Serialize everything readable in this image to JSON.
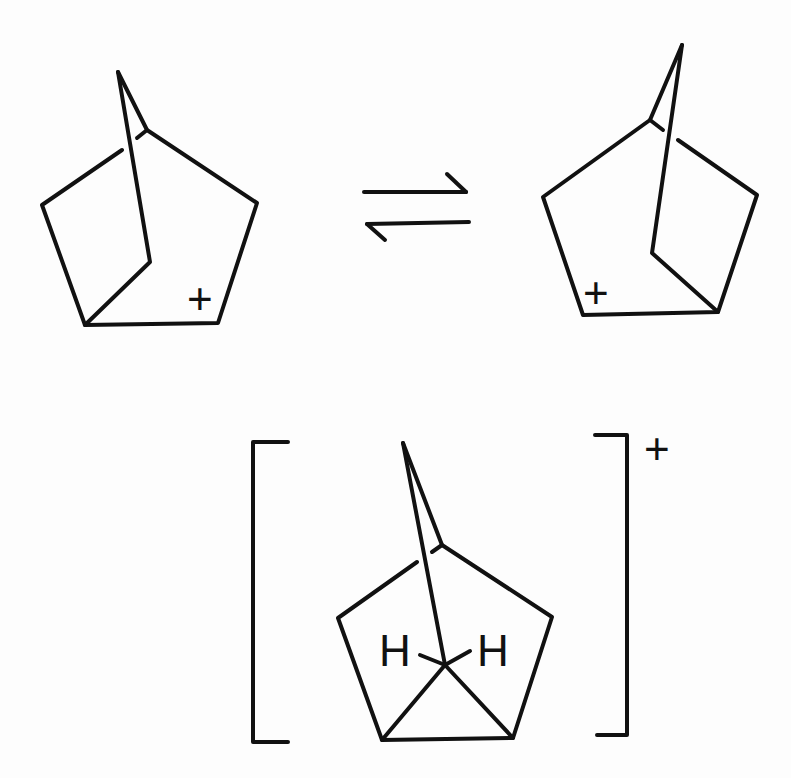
{
  "diagram": {
    "type": "chemical-reaction-scheme",
    "colors": {
      "ink": "#111111",
      "background": "#fdfdfd"
    },
    "structures": [
      {
        "id": "classical-cation-left",
        "charge_label": "+",
        "charge_position": "lower-right of ring"
      },
      {
        "id": "classical-cation-right",
        "charge_label": "+",
        "charge_position": "lower-left of ring"
      },
      {
        "id": "nonclassical-cation",
        "atom_labels": [
          "H",
          "H"
        ],
        "bracket_charge_label": "+"
      }
    ],
    "arrow": {
      "type": "equilibrium",
      "symbol": "⇌"
    }
  }
}
